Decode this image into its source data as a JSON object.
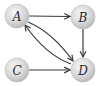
{
  "diagram": {
    "type": "directed-graph",
    "nodes": [
      {
        "id": "A",
        "label": "A",
        "cx": 17,
        "cy": 16
      },
      {
        "id": "B",
        "label": "B",
        "cx": 83,
        "cy": 17
      },
      {
        "id": "C",
        "label": "C",
        "cx": 17,
        "cy": 70
      },
      {
        "id": "D",
        "label": "D",
        "cx": 83,
        "cy": 70
      }
    ],
    "edges": [
      {
        "from": "A",
        "to": "B",
        "style": "straight"
      },
      {
        "from": "B",
        "to": "D",
        "style": "straight"
      },
      {
        "from": "C",
        "to": "D",
        "style": "straight"
      },
      {
        "from": "A",
        "to": "D",
        "style": "curved"
      },
      {
        "from": "D",
        "to": "A",
        "style": "curved"
      }
    ],
    "colors": {
      "node_fill_light": "#f4f4f4",
      "node_fill_dark": "#bdbdbd",
      "node_stroke": "#b0b0b0",
      "edge": "#3a3a3a",
      "label": "#2a2a2a"
    }
  }
}
